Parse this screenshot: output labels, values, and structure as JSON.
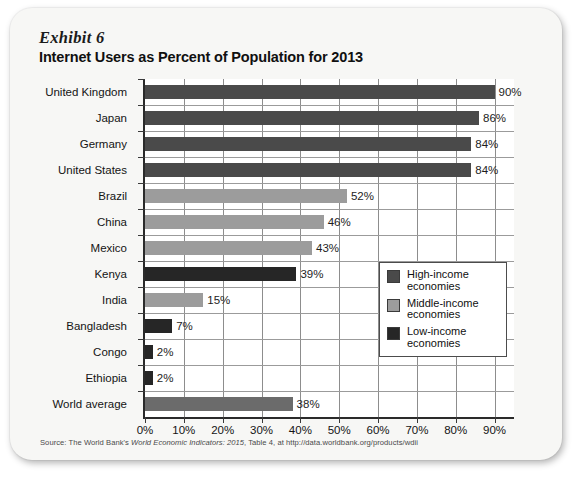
{
  "exhibit": {
    "label": "Exhibit 6",
    "title": "Internet Users as Percent of Population for 2013"
  },
  "source": {
    "prefix": "Source: The World Bank's ",
    "italic": "World Economic Indicators: 2015",
    "suffix": ", Table 4, at http://data.worldbank.org/products/wdii"
  },
  "legend": {
    "position": "inside-right-middle",
    "items": [
      {
        "label_line1": "High-income",
        "label_line2": "economies",
        "color": "#4a4a4a",
        "key": "high-income"
      },
      {
        "label_line1": "Middle-income",
        "label_line2": "economies",
        "color": "#9c9c9c",
        "key": "middle-income"
      },
      {
        "label_line1": "Low-income",
        "label_line2": "economies",
        "color": "#262626",
        "key": "low-income"
      }
    ]
  },
  "chart_data": {
    "type": "bar",
    "orientation": "horizontal",
    "title": "Internet Users as Percent of Population for 2013",
    "xlabel": "",
    "ylabel": "",
    "xlim": [
      0,
      95
    ],
    "xticks": [
      0,
      10,
      20,
      30,
      40,
      50,
      60,
      70,
      80,
      90
    ],
    "xtick_labels": [
      "0%",
      "10%",
      "20%",
      "30%",
      "40%",
      "50%",
      "60%",
      "70%",
      "80%",
      "90%"
    ],
    "grid": "vertical",
    "categories": [
      "United Kingdom",
      "Japan",
      "Germany",
      "United States",
      "Brazil",
      "China",
      "Mexico",
      "Kenya",
      "India",
      "Bangladesh",
      "Congo",
      "Ethiopia",
      "World average"
    ],
    "values": [
      90,
      86,
      84,
      84,
      52,
      46,
      43,
      39,
      15,
      7,
      2,
      2,
      38
    ],
    "value_labels": [
      "90%",
      "86%",
      "84%",
      "84%",
      "52%",
      "46%",
      "43%",
      "39%",
      "15%",
      "7%",
      "2%",
      "2%",
      "38%"
    ],
    "group_keys": [
      "high-income",
      "high-income",
      "high-income",
      "high-income",
      "middle-income",
      "middle-income",
      "middle-income",
      "low-income",
      "middle-income",
      "low-income",
      "low-income",
      "low-income",
      "world-average"
    ],
    "colors": {
      "high-income": "#4a4a4a",
      "middle-income": "#9c9c9c",
      "low-income": "#262626",
      "world-average": "#6b6b6b"
    }
  }
}
